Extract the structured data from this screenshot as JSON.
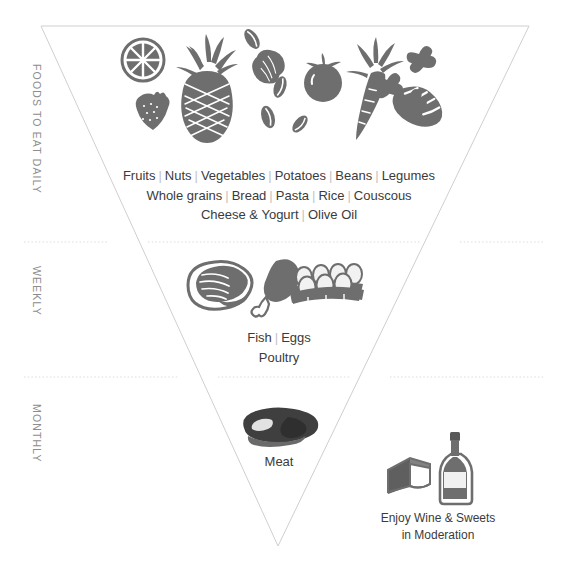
{
  "diagram": {
    "shape": "inverted-triangle",
    "outline_color": "#cfcfcf",
    "divider_color": "#dcdcdc",
    "icon_color": "#6e6e6e",
    "text_color": "#3b3b3b",
    "separator_color": "#c3c3c3",
    "rail_label_color": "#8d8d8d",
    "background_color": "#ffffff"
  },
  "rail": {
    "daily": "FOODS TO EAT DAILY",
    "weekly": "WEEKLY",
    "monthly": "MONTHLY"
  },
  "tiers": {
    "daily": {
      "rows": [
        {
          "items": [
            "Fruits",
            "Nuts",
            "Vegetables",
            "Potatoes",
            "Beans",
            "Legumes"
          ]
        },
        {
          "items": [
            "Whole grains",
            "Bread",
            "Pasta",
            "Rice",
            "Couscous"
          ]
        },
        {
          "items": [
            "Cheese & Yogurt",
            "Olive Oil"
          ]
        }
      ],
      "icons": [
        "orange-slice-icon",
        "strawberry-icon",
        "pineapple-icon",
        "peanut-icon",
        "bean-icon",
        "tomato-icon",
        "carrot-icon",
        "bread-loaf-icon",
        "farfalle-pasta-icon"
      ]
    },
    "weekly": {
      "rows": [
        {
          "items": [
            "Fish",
            "Eggs"
          ]
        },
        {
          "items": [
            "Poultry"
          ]
        }
      ],
      "icons": [
        "salmon-steak-icon",
        "chicken-drumstick-icon",
        "egg-carton-icon"
      ]
    },
    "monthly": {
      "rows": [
        {
          "items": [
            "Meat"
          ]
        }
      ],
      "icons": [
        "steak-icon"
      ]
    }
  },
  "moderation": {
    "line1": "Enjoy Wine & Sweets",
    "line2": "in Moderation",
    "icons": [
      "cake-slice-icon",
      "wine-bottle-icon"
    ]
  }
}
